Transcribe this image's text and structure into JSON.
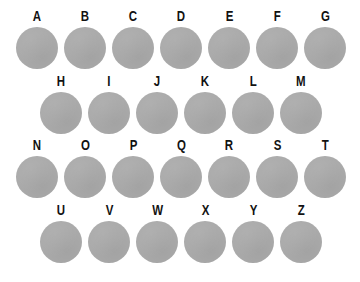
{
  "canvas": {
    "width": 360,
    "height": 282,
    "background_color": "#ffffff"
  },
  "style": {
    "dot_color": "#aaaaaa",
    "label_color": "#121212",
    "dot_diameter_px": 42
  },
  "grid": {
    "row_count": 4,
    "total_items": 26,
    "arrangement": "staggered-offset",
    "rows": [
      {
        "index": 1,
        "alignment": "flush-left",
        "item_count": 7,
        "items": [
          {
            "label": "A",
            "shape": "circle"
          },
          {
            "label": "B",
            "shape": "circle"
          },
          {
            "label": "C",
            "shape": "circle"
          },
          {
            "label": "D",
            "shape": "circle"
          },
          {
            "label": "E",
            "shape": "circle"
          },
          {
            "label": "F",
            "shape": "circle"
          },
          {
            "label": "G",
            "shape": "circle"
          }
        ]
      },
      {
        "index": 2,
        "alignment": "indented",
        "item_count": 6,
        "items": [
          {
            "label": "H",
            "shape": "circle"
          },
          {
            "label": "I",
            "shape": "circle"
          },
          {
            "label": "J",
            "shape": "circle"
          },
          {
            "label": "K",
            "shape": "circle"
          },
          {
            "label": "L",
            "shape": "circle"
          },
          {
            "label": "M",
            "shape": "circle"
          }
        ]
      },
      {
        "index": 3,
        "alignment": "flush-left",
        "item_count": 7,
        "items": [
          {
            "label": "N",
            "shape": "circle"
          },
          {
            "label": "O",
            "shape": "circle"
          },
          {
            "label": "P",
            "shape": "circle"
          },
          {
            "label": "Q",
            "shape": "circle"
          },
          {
            "label": "R",
            "shape": "circle"
          },
          {
            "label": "S",
            "shape": "circle"
          },
          {
            "label": "T",
            "shape": "circle"
          }
        ]
      },
      {
        "index": 4,
        "alignment": "indented",
        "item_count": 6,
        "items": [
          {
            "label": "U",
            "shape": "circle"
          },
          {
            "label": "V",
            "shape": "circle"
          },
          {
            "label": "W",
            "shape": "circle"
          },
          {
            "label": "X",
            "shape": "circle"
          },
          {
            "label": "Y",
            "shape": "circle"
          },
          {
            "label": "Z",
            "shape": "circle"
          }
        ]
      }
    ]
  }
}
